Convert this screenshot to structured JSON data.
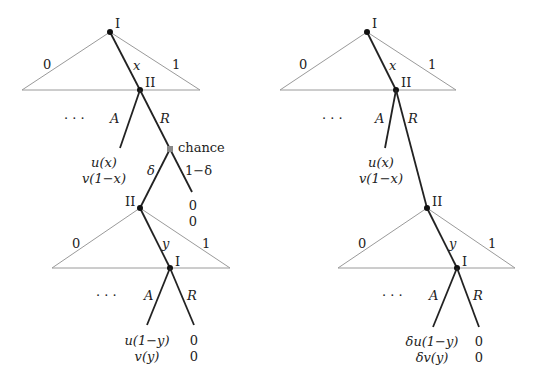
{
  "diagrams": [
    {
      "name": "left-tree",
      "nodes": {
        "root_player": "I",
        "second_player": "II",
        "chance_label": "chance",
        "second_round_proposer": "II",
        "second_round_responder": "I"
      },
      "edges": {
        "triangle_left": "0",
        "triangle_right": "1",
        "offer": "x",
        "accept": "A",
        "reject": "R",
        "continue": "δ",
        "breakdown": "1−δ",
        "triangle2_left": "0",
        "triangle2_right": "1",
        "offer2": "y",
        "accept2": "A",
        "reject2": "R"
      },
      "ellipsis": "· · ·",
      "ellipsis2": "· · ·",
      "payoffs": {
        "accept_1": [
          "u(x)",
          "v(1−x)"
        ],
        "breakdown": [
          "0",
          "0"
        ],
        "accept_2": [
          "u(1−y)",
          "v(y)"
        ],
        "reject_2": [
          "0",
          "0"
        ]
      }
    },
    {
      "name": "right-tree",
      "nodes": {
        "root_player": "I",
        "second_player": "II",
        "second_round_proposer": "II",
        "second_round_responder": "I"
      },
      "edges": {
        "triangle_left": "0",
        "triangle_right": "1",
        "offer": "x",
        "accept": "A",
        "reject": "R",
        "triangle2_left": "0",
        "triangle2_right": "1",
        "offer2": "y",
        "accept2": "A",
        "reject2": "R"
      },
      "ellipsis": "· · ·",
      "ellipsis2": "· · ·",
      "payoffs": {
        "accept_1": [
          "u(x)",
          "v(1−x)"
        ],
        "accept_2": [
          "δu(1−y)",
          "δv(y)"
        ],
        "reject_2": [
          "0",
          "0"
        ]
      }
    }
  ]
}
